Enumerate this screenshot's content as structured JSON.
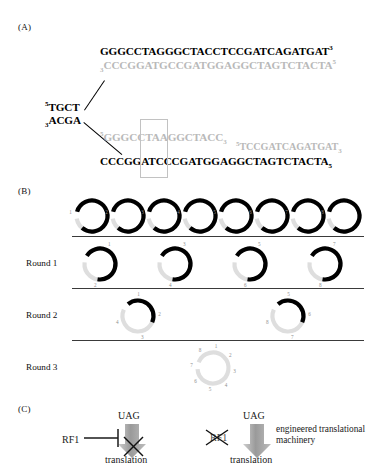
{
  "figure": {
    "panels": {
      "a": {
        "label": "(A)"
      },
      "b": {
        "label": "(B)"
      },
      "c": {
        "label": "(C)"
      }
    }
  },
  "panel_a": {
    "left_strand_top": "TGCT",
    "left_strand_top_prime": "5",
    "left_strand_bottom": "ACGA",
    "left_strand_bottom_prime": "3",
    "top_branch": {
      "black_sequence": "GGGCCTAGGGCTACCTCCGATCAGATGAT",
      "black_end_prime": "3",
      "gray_start_prime": "3",
      "gray_sequence": "CCCGGATGCCGATGGAGGCTAGTCTACTA",
      "gray_end_prime": "5"
    },
    "bottom_branch": {
      "gray_start_prime": "5",
      "gray_sequence": "GGGCCTAAGGCTACC",
      "gray_end_prime": "3",
      "gray_fragment_start_prime": "5",
      "gray_fragment": "TCCGATCAGATGAT",
      "gray_fragment_end_prime": "3",
      "black_sequence": "CCCGGATCCCGATGGAGGCTAGTCTACTA",
      "black_end_prime": "5"
    },
    "highlight_box": "codon-highlight"
  },
  "panel_b": {
    "rounds": [
      {
        "label": "Round 1"
      },
      {
        "label": "Round 2"
      },
      {
        "label": "Round 3"
      }
    ],
    "top_row": {
      "count": 8,
      "circles": [
        {
          "numbers": [
            "1"
          ]
        },
        {
          "numbers": [
            "2"
          ]
        },
        {
          "numbers": [
            "3"
          ]
        },
        {
          "numbers": [
            "4"
          ]
        },
        {
          "numbers": [
            "5"
          ]
        },
        {
          "numbers": [
            "6"
          ]
        },
        {
          "numbers": [
            "7"
          ]
        },
        {
          "numbers": [
            "8"
          ]
        }
      ]
    },
    "round1_row": {
      "count": 4,
      "circles": [
        {
          "numbers": [
            "1",
            "2"
          ]
        },
        {
          "numbers": [
            "3",
            "4"
          ]
        },
        {
          "numbers": [
            "5",
            "6"
          ]
        },
        {
          "numbers": [
            "7",
            "8"
          ]
        }
      ]
    },
    "round2_row": {
      "count": 2,
      "circles": [
        {
          "numbers": [
            "1",
            "2",
            "3",
            "4"
          ]
        },
        {
          "numbers": [
            "5",
            "6",
            "7",
            "8"
          ]
        }
      ]
    },
    "round3_row": {
      "count": 1,
      "circles": [
        {
          "numbers": [
            "1",
            "2",
            "3",
            "4",
            "5",
            "6",
            "7",
            "8"
          ]
        }
      ]
    }
  },
  "panel_c": {
    "left": {
      "codon": "UAG",
      "factor": "RF1",
      "outcome": "translation",
      "outcome_blocked": true
    },
    "right": {
      "codon": "UAG",
      "factor": "RF1",
      "factor_removed": true,
      "annotation": "engineered translational machinery",
      "outcome": "translation",
      "outcome_blocked": false
    }
  },
  "colors": {
    "black": "#000000",
    "gray_strand": "#b9b9b9",
    "box_outline": "#c2c2c2",
    "divider": "#3a3a3a",
    "number_gray": "#8f8f8f",
    "arrow_gray": "#9a9a9a"
  }
}
